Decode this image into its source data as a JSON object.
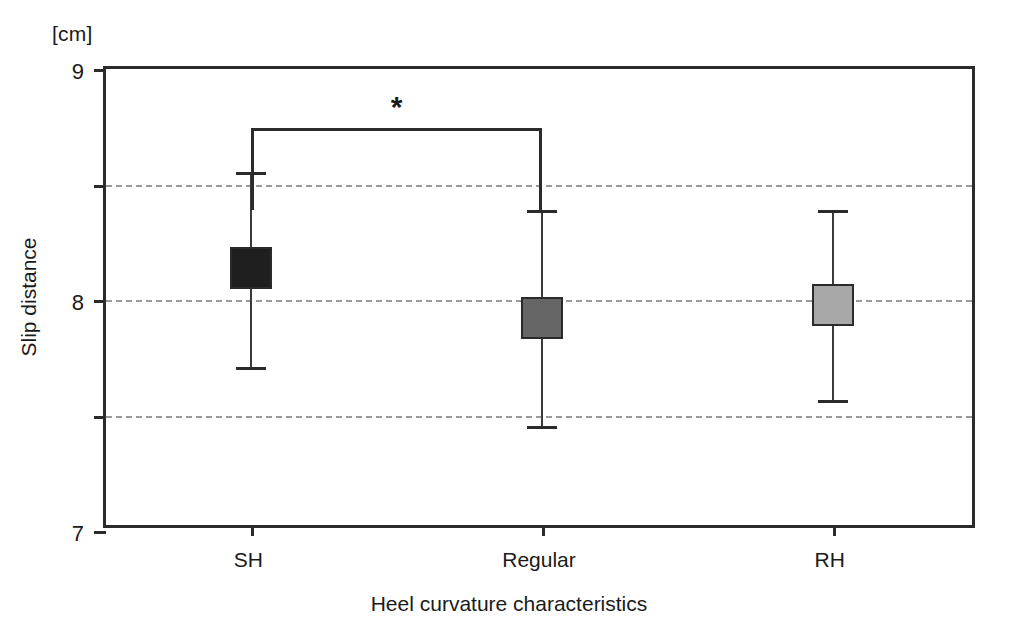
{
  "chart_data": {
    "type": "scatter",
    "title": "",
    "unit_label": "[cm]",
    "xlabel": "Heel curvature characteristics",
    "ylabel": "Slip distance",
    "categories": [
      "SH",
      "Regular",
      "RH"
    ],
    "ylim": [
      5,
      9
    ],
    "yticks": [
      9,
      8,
      7,
      6,
      5
    ],
    "gridlines": [
      8,
      7,
      6
    ],
    "grid": true,
    "legend": "none",
    "series": [
      {
        "name": "Slip distance (mean ± SD)",
        "values": [
          7.28,
          6.84,
          6.96
        ],
        "err_high": [
          8.11,
          7.78,
          7.78
        ],
        "err_low": [
          6.42,
          5.91,
          6.13
        ],
        "marker_colors": [
          "#1f1f1f",
          "#666666",
          "#a8a8a8"
        ]
      }
    ],
    "annotations": [
      {
        "type": "significance-bracket",
        "label": "*",
        "from": "SH",
        "to": "Regular",
        "y": 8.49
      }
    ]
  },
  "axis": {
    "y_tick_labels": [
      "9",
      "8",
      "7",
      "6",
      "5"
    ],
    "x_tick_labels": [
      "SH",
      "Regular",
      "RH"
    ]
  }
}
